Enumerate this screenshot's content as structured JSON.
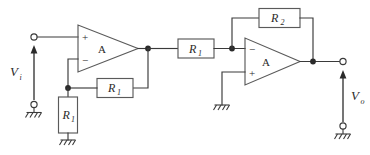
{
  "diagram": {
    "type": "schematic",
    "colors": {
      "wire": "#3a3a3a",
      "component_outline": "#5a5a5a",
      "label": "#2b2b2b",
      "background": "#ffffff"
    },
    "signals": {
      "input": {
        "symbol": "V",
        "subscript": "i"
      },
      "output": {
        "symbol": "V",
        "subscript": "o"
      }
    },
    "opamps": [
      {
        "id": "opamp-left",
        "label": "A",
        "top_input_sign": "+",
        "bottom_input_sign": "−"
      },
      {
        "id": "opamp-right",
        "label": "A",
        "top_input_sign": "−",
        "bottom_input_sign": "+"
      }
    ],
    "resistors": [
      {
        "id": "resistor-r1-shunt",
        "symbol": "R",
        "subscript": "1",
        "orientation": "vertical"
      },
      {
        "id": "resistor-r1-feedback",
        "symbol": "R",
        "subscript": "1",
        "orientation": "horizontal"
      },
      {
        "id": "resistor-r1-series",
        "symbol": "R",
        "subscript": "1",
        "orientation": "horizontal"
      },
      {
        "id": "resistor-r2-feedback",
        "symbol": "R",
        "subscript": "2",
        "orientation": "horizontal"
      }
    ],
    "grounds": [
      {
        "id": "ground-input"
      },
      {
        "id": "ground-shunt"
      },
      {
        "id": "ground-noninverting"
      },
      {
        "id": "ground-output"
      }
    ]
  }
}
